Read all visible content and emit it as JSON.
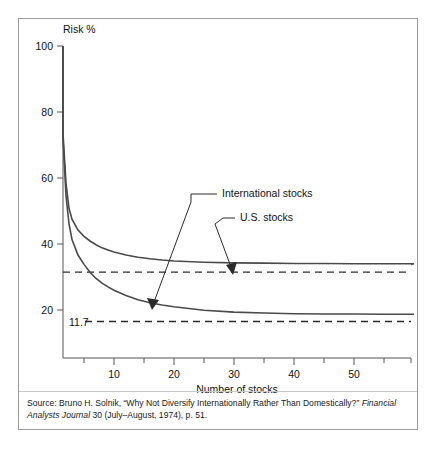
{
  "figure": {
    "y_axis_title": "Risk %",
    "x_axis_title": "Number of stocks",
    "threshold_label": "11.7",
    "annotations": {
      "international": "International stocks",
      "us": "U.S. stocks"
    },
    "source": {
      "line1_prefix": "Source: Bruno H. Solnik, “Why Not Diversify Internationally Rather Than Domestically?” ",
      "line1_italic": "Financial",
      "line2_italic": "Analysts Journal",
      "line2_suffix": " 30 (July–August, 1974), p. 51."
    }
  },
  "chart_data": {
    "type": "line",
    "title": "",
    "subtitle": "",
    "xlabel": "Number of stocks",
    "ylabel": "Risk %",
    "xlim": [
      0,
      60
    ],
    "ylim": [
      0,
      100
    ],
    "grid": false,
    "legend_position": "inline-annotations",
    "xticks": [
      10,
      20,
      30,
      40,
      50
    ],
    "xticks_minor": [
      5,
      15,
      25,
      35,
      45,
      55
    ],
    "yticks": [
      20,
      40,
      60,
      80,
      100
    ],
    "series": [
      {
        "name": "International stocks",
        "asymptote": 30,
        "x": [
          1,
          1.5,
          2,
          2.5,
          3,
          4,
          5,
          6,
          7,
          8,
          9,
          10,
          12,
          14,
          16,
          18,
          20,
          25,
          30,
          35,
          40,
          45,
          50,
          55,
          60
        ],
        "values": [
          100,
          72,
          56,
          48,
          44.5,
          41,
          39,
          37.5,
          36.3,
          35.3,
          34.6,
          34,
          33,
          32.3,
          31.8,
          31.4,
          31.1,
          30.7,
          30.5,
          30.4,
          30.3,
          30.3,
          30.2,
          30.2,
          30.2
        ]
      },
      {
        "name": "U.S. stocks",
        "asymptote": 14,
        "x": [
          1,
          1.5,
          2,
          2.5,
          3,
          4,
          5,
          6,
          7,
          8,
          9,
          10,
          12,
          14,
          16,
          18,
          20,
          25,
          30,
          35,
          40,
          45,
          50,
          55,
          60
        ],
        "values": [
          100,
          70,
          52,
          43,
          38,
          33,
          30,
          27.5,
          25.5,
          24,
          22.8,
          21.7,
          20,
          18.7,
          17.7,
          17,
          16.4,
          15.3,
          14.7,
          14.4,
          14.2,
          14.1,
          14.1,
          14.0,
          14.0
        ]
      }
    ],
    "reference_lines": [
      {
        "name": "international-systematic-risk",
        "value": 27.5,
        "style": "dashed",
        "label": ""
      },
      {
        "name": "us-systematic-risk",
        "value": 11.7,
        "style": "dashed",
        "label": "11.7"
      }
    ],
    "annotations": [
      {
        "text": "International stocks",
        "points_to_series": "International stocks",
        "point_x": 10,
        "point_y": 21.7
      },
      {
        "text": "U.S. stocks",
        "points_to_series": "U.S. stocks",
        "point_x": 20,
        "point_y": 31.1
      }
    ]
  }
}
